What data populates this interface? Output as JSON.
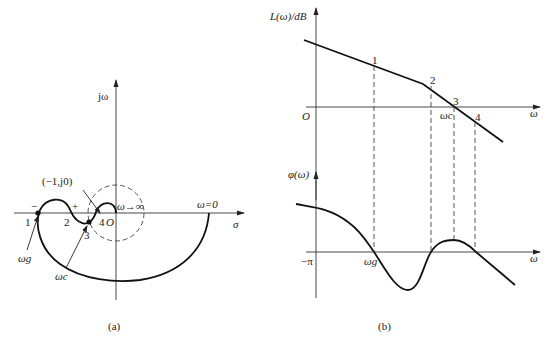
{
  "panel_a": {
    "caption": "(a)",
    "imag_axis_label": "jω",
    "real_axis_label": "σ",
    "origin_label": "O",
    "critical_point_label": "(−1,j0)",
    "omega_inf_label": "ω→∞",
    "omega_zero_label": "ω=0",
    "sign_minus": "−",
    "sign_plus": "+",
    "points": [
      "1",
      "2",
      "3",
      "4"
    ],
    "omega_g_label": "ωg",
    "omega_c_label": "ωc"
  },
  "panel_b": {
    "caption": "(b)",
    "magnitude": {
      "y_label": "L(ω)/dB",
      "x_label": "ω",
      "origin_label": "O",
      "points": [
        "1",
        "2",
        "3",
        "4"
      ],
      "omega_c_label": "ωc"
    },
    "phase": {
      "y_label": "φ(ω)",
      "x_label": "ω",
      "ref_label": "−π",
      "omega_g_label": "ωg"
    }
  }
}
